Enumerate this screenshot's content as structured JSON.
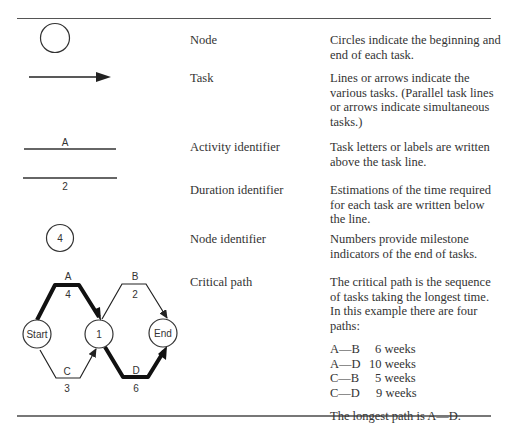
{
  "table": {
    "rows": [
      {
        "symbol": "circle",
        "name": "Node",
        "description": "Circles indicate the beginning and end of each task."
      },
      {
        "symbol": "arrow",
        "name": "Task",
        "description": "Lines or arrows indicate the various tasks. (Parallel task lines or arrows indicate simultaneous tasks.)"
      },
      {
        "symbol": "line-with-label-above",
        "symbol_label": "A",
        "name": "Activity identifier",
        "description": "Task letters or labels are written above the task line."
      },
      {
        "symbol": "line-with-label-below",
        "symbol_label": "2",
        "name": "Duration identifier",
        "description": "Estimations of the time required for each task are written below the line."
      },
      {
        "symbol": "numbered-circle",
        "symbol_label": "4",
        "name": "Node identifier",
        "description": "Numbers provide milestone indicators of the end of tasks."
      },
      {
        "symbol": "network-diagram",
        "name": "Critical path",
        "description": "The critical path is the sequence of tasks taking the longest time. In this example there are four paths:",
        "paths": [
          {
            "path": "A—B",
            "duration": "6 weeks"
          },
          {
            "path": "A—D",
            "duration": "10 weeks"
          },
          {
            "path": "C—B",
            "duration": "5 weeks"
          },
          {
            "path": "C—D",
            "duration": "9 weeks"
          }
        ],
        "conclusion": "The longest path is A—D."
      }
    ]
  },
  "diagram": {
    "nodes": {
      "start": "Start",
      "middle": "1",
      "end": "End"
    },
    "tasks": [
      {
        "label": "A",
        "duration": "4",
        "critical": true
      },
      {
        "label": "B",
        "duration": "2",
        "critical": false
      },
      {
        "label": "C",
        "duration": "3",
        "critical": false
      },
      {
        "label": "D",
        "duration": "6",
        "critical": true
      }
    ]
  }
}
